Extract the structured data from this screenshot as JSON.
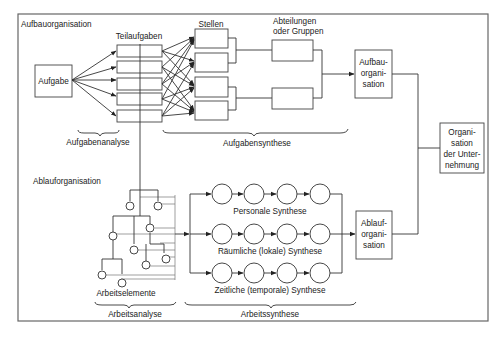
{
  "sections": {
    "aufbau_title": "Aufbauorganisation",
    "ablauf_title": "Ablauforganisation"
  },
  "aufbau": {
    "aufgabe": "Aufgabe",
    "teilaufgaben_label": "Teilaufgaben",
    "stellen_label": "Stellen",
    "abteilungen_label_line1": "Abteilungen",
    "abteilungen_label_line2": "oder Gruppen",
    "aufgabenanalyse": "Aufgabenanalyse",
    "aufgabensynthese": "Aufgabensynthese",
    "result_line1": "Aufbau-",
    "result_line2": "organi-",
    "result_line3": "sation"
  },
  "ablauf": {
    "arbeitselemente": "Arbeitselemente",
    "arbeitsanalyse": "Arbeitsanalyse",
    "arbeitssynthese": "Arbeitssynthese",
    "rows": [
      {
        "label": "Personale Synthese"
      },
      {
        "label": "Räumliche (lokale) Synthese"
      },
      {
        "label": "Zeitliche (temporale) Synthese"
      }
    ],
    "result_line1": "Ablauf-",
    "result_line2": "organi-",
    "result_line3": "sation"
  },
  "final": {
    "line1": "Organi-",
    "line2": "sation",
    "line3": "der Unter-",
    "line4": "nehmung"
  }
}
